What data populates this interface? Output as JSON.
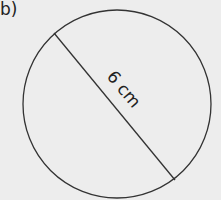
{
  "part_label": "b)",
  "figure": {
    "shape": "circle",
    "measurement": "diameter",
    "dimension_label": "6 cm",
    "stroke_color": "#333333",
    "background_color": "#ededed"
  }
}
